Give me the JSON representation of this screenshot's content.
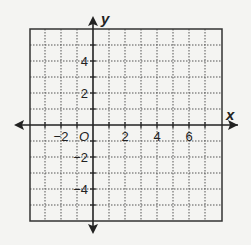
{
  "diagram": {
    "type": "coordinate-plane",
    "x_axis": {
      "label": "x",
      "min": -4,
      "max": 8,
      "tick_labels": [
        "-2",
        "2",
        "4",
        "6"
      ],
      "tick_values": [
        -2,
        2,
        4,
        6
      ]
    },
    "y_axis": {
      "label": "y",
      "min": -6,
      "max": 6,
      "tick_labels": [
        "4",
        "2",
        "-2",
        "-4"
      ],
      "tick_values": [
        4,
        2,
        -2,
        -4
      ]
    },
    "origin_label": "O",
    "grid": {
      "spacing": 1,
      "style": "dotted"
    },
    "colors": {
      "background": "#f4f4f2",
      "grid": "#555555",
      "axis": "#222222",
      "border": "#333333"
    }
  }
}
